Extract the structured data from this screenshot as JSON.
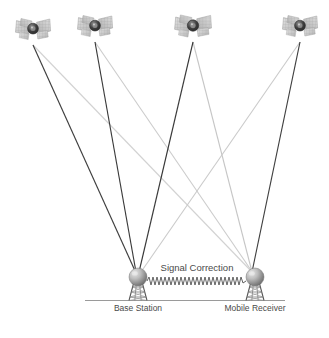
{
  "figure": {
    "kind": "gnss-dgps-architecture-diagram",
    "background_color": "#ffffff",
    "width": 329,
    "height": 338
  },
  "labels": {
    "base_station": "Base Station",
    "mobile_receiver": "Mobile Receiver",
    "signal_correction": "Signal Correction"
  },
  "colors": {
    "dark_ray": "#3c3c3c",
    "light_ray": "#cfcfcf",
    "mid_ray": "#b8b8b8",
    "ground_line": "#9a9a9a",
    "tower": "#555555",
    "sphere_dark": "#6e6e6e",
    "sphere_light": "#d6d6d6",
    "panel_light": "#d9d9d9",
    "panel_mid": "#bdbdbd",
    "hub_dark": "#3a3a3a",
    "text": "#4a4a4a",
    "wave": "#5a5a5a"
  },
  "satellites": [
    {
      "name": "satellite-1",
      "x": 33,
      "y": 30,
      "scale": 1.0,
      "ray_dark_to": "base",
      "ray_light_to": "mobile"
    },
    {
      "name": "satellite-2",
      "x": 95,
      "y": 27,
      "scale": 1.0,
      "ray_dark_to": "base",
      "ray_light_to": "mobile"
    },
    {
      "name": "satellite-3",
      "x": 193,
      "y": 27,
      "scale": 1.05,
      "ray_dark_to": "base",
      "ray_light_to": "mobile"
    },
    {
      "name": "satellite-4",
      "x": 300,
      "y": 27,
      "scale": 1.0,
      "ray_dark_to": "mobile",
      "ray_light_to": "base"
    }
  ],
  "stations": {
    "base": {
      "x": 138,
      "y": 277,
      "sphere_r": 9
    },
    "mobile": {
      "x": 255,
      "y": 277,
      "sphere_r": 9
    }
  },
  "ground": {
    "x1": 85,
    "x2": 285,
    "y": 300
  },
  "correction_link": {
    "x1": 149,
    "x2": 246,
    "y": 281,
    "amplitude": 4,
    "cycles": 24
  },
  "geometry_notes": {
    "ray_count": 8,
    "towers": 2,
    "label_y": 311
  }
}
